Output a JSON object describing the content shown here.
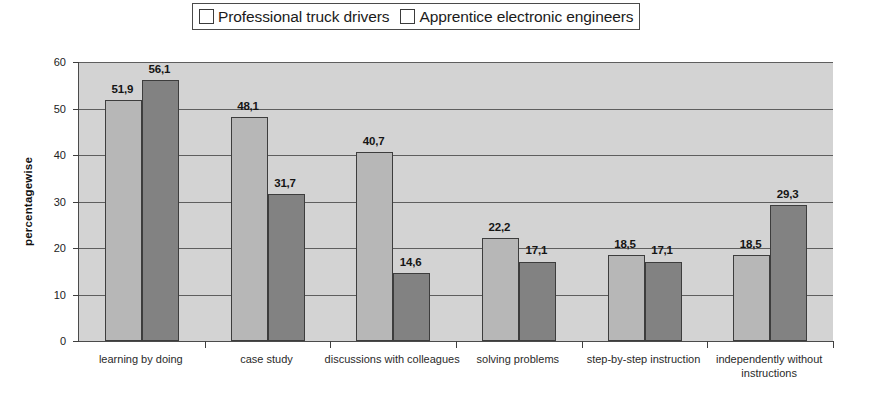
{
  "chart_data": {
    "type": "bar",
    "title": "",
    "subtitle": "",
    "xlabel": "",
    "ylabel": "percentagewise",
    "ylim": [
      0,
      60
    ],
    "ytick_labels": [
      "0",
      "10",
      "20",
      "30",
      "40",
      "50",
      "60"
    ],
    "ytick_values": [
      0,
      10,
      20,
      30,
      40,
      50,
      60
    ],
    "grid": true,
    "legend_position": "top-center",
    "categories": [
      "learning by doing",
      "case study",
      "discussions with colleagues",
      "solving problems",
      "step-by-step instruction",
      "independently without instructions"
    ],
    "series": [
      {
        "name": "Professional truck drivers",
        "color": "#b7b7b7",
        "values": [
          51.9,
          48.1,
          40.7,
          22.2,
          18.5,
          18.5
        ],
        "value_labels": [
          "51,9",
          "48,1",
          "40,7",
          "22,2",
          "18,5",
          "18,5"
        ]
      },
      {
        "name": "Apprentice electronic engineers",
        "color": "#828282",
        "values": [
          56.1,
          31.7,
          14.6,
          17.1,
          17.1,
          29.3
        ],
        "value_labels": [
          "56,1",
          "31,7",
          "14,6",
          "17,1",
          "17,1",
          "29,3"
        ]
      }
    ]
  }
}
